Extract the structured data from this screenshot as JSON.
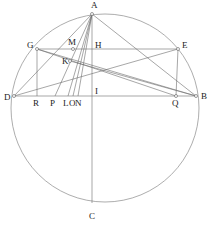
{
  "figure": {
    "name": "circle-geometry-construction",
    "type": "euclidean-geometry-diagram",
    "background_color": "#ffffff",
    "line_color": "#6c6c6c",
    "circle_color": "#8a8a8a",
    "label_color": "#1a1a1a",
    "canvas": {
      "width": 209,
      "height": 227
    },
    "circle": {
      "cx": 105,
      "cy": 108,
      "r": 94
    },
    "points": [
      {
        "id": "A",
        "label": "A",
        "x": 92,
        "y": 14,
        "lx": 91,
        "ly": 8,
        "marker": "open"
      },
      {
        "id": "B",
        "label": "B",
        "x": 196,
        "y": 96,
        "lx": 201,
        "ly": 99,
        "marker": "open"
      },
      {
        "id": "C",
        "label": "C",
        "x": 92,
        "y": 203,
        "lx": 89,
        "ly": 219,
        "marker": "none"
      },
      {
        "id": "D",
        "label": "D",
        "x": 14,
        "y": 96,
        "lx": 4,
        "ly": 100,
        "marker": "open"
      },
      {
        "id": "E",
        "label": "E",
        "x": 178,
        "y": 49,
        "lx": 182,
        "ly": 48,
        "marker": "open"
      },
      {
        "id": "G",
        "label": "G",
        "x": 37,
        "y": 49,
        "lx": 27,
        "ly": 48,
        "marker": "open"
      },
      {
        "id": "H",
        "label": "H",
        "x": 92,
        "y": 49,
        "lx": 95,
        "ly": 48,
        "marker": "none"
      },
      {
        "id": "I",
        "label": "I",
        "x": 92,
        "y": 96,
        "lx": 95,
        "ly": 94,
        "marker": "none"
      },
      {
        "id": "K",
        "label": "K",
        "x": 70,
        "y": 61,
        "lx": 62,
        "ly": 64,
        "marker": "open"
      },
      {
        "id": "L",
        "label": "L",
        "x": 68,
        "y": 96,
        "lx": 63,
        "ly": 106,
        "marker": "none"
      },
      {
        "id": "M",
        "label": "M",
        "x": 73,
        "y": 49,
        "lx": 68,
        "ly": 45,
        "marker": "open"
      },
      {
        "id": "N",
        "label": "N",
        "x": 78,
        "y": 96,
        "lx": 75,
        "ly": 106,
        "marker": "none"
      },
      {
        "id": "O",
        "label": "O",
        "x": 73,
        "y": 96,
        "lx": 69,
        "ly": 106,
        "marker": "none"
      },
      {
        "id": "P",
        "label": "P",
        "x": 55,
        "y": 96,
        "lx": 50,
        "ly": 106,
        "marker": "none"
      },
      {
        "id": "Q",
        "label": "Q",
        "x": 176,
        "y": 96,
        "lx": 172,
        "ly": 106,
        "marker": "open"
      },
      {
        "id": "R",
        "label": "R",
        "x": 37,
        "y": 96,
        "lx": 33,
        "ly": 106,
        "marker": "none"
      }
    ],
    "segments": [
      {
        "name": "chord-DB-diameter",
        "from": "D",
        "to": "B"
      },
      {
        "name": "chord-GE",
        "from": "G",
        "to": "E"
      },
      {
        "name": "axis-AC",
        "from": "A",
        "to": "C"
      },
      {
        "name": "side-AD",
        "from": "A",
        "to": "D"
      },
      {
        "name": "side-AB",
        "from": "A",
        "to": "B"
      },
      {
        "name": "cevian-AP",
        "from": "A",
        "to": "P"
      },
      {
        "name": "cevian-AL",
        "from": "A",
        "to": "L"
      },
      {
        "name": "cevian-AO",
        "from": "A",
        "to": "O"
      },
      {
        "name": "cevian-AN",
        "from": "A",
        "to": "N"
      },
      {
        "name": "perp-GR",
        "from": "G",
        "to": "R"
      },
      {
        "name": "perp-EQ",
        "from": "E",
        "to": "Q"
      },
      {
        "name": "diagonal-GB",
        "from": "G",
        "to": "B"
      },
      {
        "name": "diagonal-DE",
        "from": "D",
        "to": "E"
      },
      {
        "name": "diagonal-KB",
        "from": "K",
        "to": "B"
      },
      {
        "name": "diagonal-GQ",
        "from": "G",
        "to": "Q"
      }
    ],
    "labels_order": [
      "A",
      "G",
      "M",
      "H",
      "E",
      "K",
      "D",
      "R",
      "P",
      "L",
      "O",
      "N",
      "I",
      "Q",
      "B",
      "C"
    ]
  }
}
